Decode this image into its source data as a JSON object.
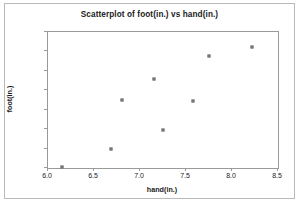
{
  "chart_data": {
    "type": "scatter",
    "title": "Scatterplot of foot(in.) vs hand(in.)",
    "xlabel": "hand(in.)",
    "ylabel": "foot(in.)",
    "xlim": [
      6.0,
      8.5
    ],
    "ylim": [
      8.5,
      12.0
    ],
    "xticks": [
      "6.0",
      "6.5",
      "7.0",
      "7.5",
      "8.0",
      "8.5"
    ],
    "yticks": [
      "8.5",
      "9.0",
      "9.5",
      "10.0",
      "10.5",
      "11.0",
      "11.5",
      "12.0"
    ],
    "grid": false,
    "legend": null,
    "marker_color": "#8d8d95",
    "points": [
      {
        "x": 6.15,
        "y": 8.52
      },
      {
        "x": 6.68,
        "y": 9.0
      },
      {
        "x": 6.8,
        "y": 10.25
      },
      {
        "x": 7.15,
        "y": 10.8
      },
      {
        "x": 7.25,
        "y": 9.47
      },
      {
        "x": 7.58,
        "y": 10.22
      },
      {
        "x": 7.75,
        "y": 11.37
      },
      {
        "x": 8.22,
        "y": 11.62
      }
    ]
  }
}
